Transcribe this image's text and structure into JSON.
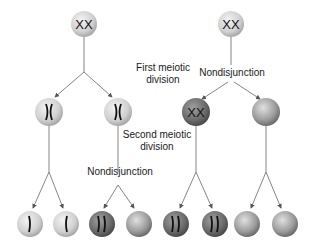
{
  "diagram": {
    "labels": {
      "first_meiotic_division": [
        "First meiotic",
        "division"
      ],
      "second_meiotic_division": [
        "Second meiotic",
        "division"
      ],
      "nondisjunction_left": "Nondisjunction",
      "nondisjunction_right": "Nondisjunction"
    },
    "left_lineage": {
      "parent": {
        "chromosomes": "XX",
        "shade": "light"
      },
      "meiosis_I": [
        {
          "chromosomes": "X",
          "shade": "light"
        },
        {
          "chromosomes": "X",
          "shade": "light"
        }
      ],
      "gametes": [
        {
          "chromosomes": 1,
          "shade": "light"
        },
        {
          "chromosomes": 1,
          "shade": "light"
        },
        {
          "chromosomes": 2,
          "shade": "dark"
        },
        {
          "chromosomes": 0,
          "shade": "medium"
        }
      ],
      "nondisjunction_at": "Second meiotic division"
    },
    "right_lineage": {
      "parent": {
        "chromosomes": "XX",
        "shade": "light"
      },
      "meiosis_I": [
        {
          "chromosomes": "XX",
          "shade": "dark"
        },
        {
          "chromosomes": 0,
          "shade": "medium"
        }
      ],
      "gametes": [
        {
          "chromosomes": 2,
          "shade": "dark"
        },
        {
          "chromosomes": 2,
          "shade": "dark"
        },
        {
          "chromosomes": 0,
          "shade": "medium"
        },
        {
          "chromosomes": 0,
          "shade": "medium"
        }
      ],
      "nondisjunction_at": "First meiotic division"
    },
    "colors": {
      "light_cell": "#d8d8d8",
      "dark_cell": "#6e6e6e",
      "medium_cell": "#9a9a9a",
      "line": "#555555",
      "chromosome": "#111111"
    }
  }
}
